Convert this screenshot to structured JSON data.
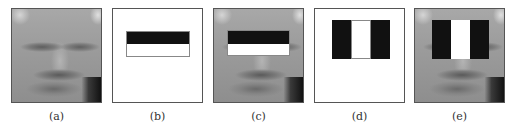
{
  "figure": {
    "panels": [
      {
        "id": "a",
        "label": "(a)",
        "content": "face image (grayscale, low resolution)"
      },
      {
        "id": "b",
        "label": "(b)",
        "content": "two-rectangle horizontal Haar-like feature: black top, white bottom, on white background"
      },
      {
        "id": "c",
        "label": "(c)",
        "content": "face image with horizontal two-rectangle feature overlaid over the eyes region"
      },
      {
        "id": "d",
        "label": "(d)",
        "content": "three-rectangle vertical Haar-like feature: black, white, black, on white background"
      },
      {
        "id": "e",
        "label": "(e)",
        "content": "face image with three-rectangle feature overlaid over eyes/nose region"
      }
    ]
  },
  "colors": {
    "feature_dark": "#111111",
    "feature_light": "#ffffff",
    "panel_border": "#555555"
  }
}
